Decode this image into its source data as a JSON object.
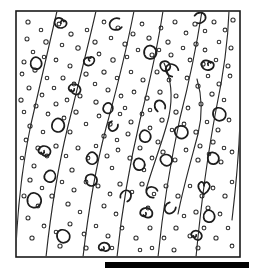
{
  "figure": {
    "description": "Rectangular framed line drawing showing sub-parallel flowing lamination lines with scattered small open circular grains and larger curved comma, C and spiral shaped bioclast outlines.",
    "background_color": "#ffffff",
    "ink_color": "#1a1a1a",
    "bar_color": "#000000"
  },
  "frame": {
    "name": "outer-frame",
    "x": 16,
    "y": 11,
    "width": 224,
    "height": 246,
    "stroke_color": "#1a1a1a",
    "stroke_width": 1.6,
    "fill_color": "#ffffff"
  },
  "base_bar": {
    "name": "base-bar",
    "x": 105,
    "y": 262,
    "width": 144,
    "height": 6,
    "color": "#000000"
  },
  "flow_lines": {
    "count": 9,
    "stroke_color": "#2a2a2a",
    "stroke_width": 1.15,
    "paths": [
      "M 57 11 C 49 45, 40 84, 31 124 C 23 161, 18 205, 16 246",
      "M 96 11 C 88 46, 78 86, 68 126 C 59 163, 51 210, 46 257",
      "M 134 11 C 127 47, 117 88, 106 128 C 96 166, 88 214, 83 257",
      "M 163 11 C 158 44, 150 81, 140 120 C 131 158, 122 209, 117 257",
      "M 202 11 C 197 43, 190 79, 180 118 C 172 155, 163 208, 158 257",
      "M 229 11 C 228 40, 224 72, 216 110 C 209 147, 201 205, 196 257",
      "M 164 63 C 171 78, 173 96, 169 116 C 164 138, 153 165, 146 190",
      "M 197 79 C 202 96, 203 114, 198 134 C 192 157, 183 188, 178 214",
      "M 240 122 C 239 150, 236 186, 232 220"
    ]
  },
  "grain_dots": {
    "name": "ooid-grains",
    "count": 150,
    "stroke_color": "#2d2d2d",
    "radius_min": 1.6,
    "radius_max": 3.1,
    "points": [
      [
        28,
        22,
        2.1
      ],
      [
        41,
        30,
        1.8
      ],
      [
        27,
        39,
        2.0
      ],
      [
        46,
        42,
        2.2
      ],
      [
        33,
        52,
        1.8
      ],
      [
        24,
        62,
        2.0
      ],
      [
        44,
        57,
        1.7
      ],
      [
        59,
        24,
        1.9
      ],
      [
        71,
        34,
        2.1
      ],
      [
        62,
        45,
        1.8
      ],
      [
        78,
        48,
        2.2
      ],
      [
        56,
        60,
        1.9
      ],
      [
        70,
        66,
        2.0
      ],
      [
        87,
        30,
        1.8
      ],
      [
        95,
        42,
        2.1
      ],
      [
        104,
        22,
        1.9
      ],
      [
        118,
        28,
        2.0
      ],
      [
        111,
        38,
        1.8
      ],
      [
        125,
        44,
        2.1
      ],
      [
        99,
        54,
        1.9
      ],
      [
        113,
        60,
        2.2
      ],
      [
        127,
        57,
        1.8
      ],
      [
        133,
        34,
        2.0
      ],
      [
        142,
        24,
        1.9
      ],
      [
        149,
        38,
        2.1
      ],
      [
        138,
        50,
        1.8
      ],
      [
        152,
        55,
        2.0
      ],
      [
        161,
        28,
        1.9
      ],
      [
        168,
        42,
        2.1
      ],
      [
        159,
        50,
        1.8
      ],
      [
        175,
        22,
        2.0
      ],
      [
        186,
        33,
        1.9
      ],
      [
        195,
        24,
        2.1
      ],
      [
        205,
        31,
        1.8
      ],
      [
        214,
        22,
        2.0
      ],
      [
        225,
        30,
        1.9
      ],
      [
        233,
        20,
        2.1
      ],
      [
        219,
        42,
        1.8
      ],
      [
        231,
        48,
        2.0
      ],
      [
        205,
        50,
        1.9
      ],
      [
        196,
        44,
        2.1
      ],
      [
        183,
        48,
        1.8
      ],
      [
        171,
        55,
        2.0
      ],
      [
        190,
        60,
        1.9
      ],
      [
        203,
        64,
        2.1
      ],
      [
        216,
        60,
        1.8
      ],
      [
        228,
        66,
        2.0
      ],
      [
        22,
        74,
        1.9
      ],
      [
        35,
        70,
        2.1
      ],
      [
        47,
        78,
        1.8
      ],
      [
        29,
        88,
        2.0
      ],
      [
        42,
        95,
        1.9
      ],
      [
        21,
        100,
        2.1
      ],
      [
        54,
        88,
        1.8
      ],
      [
        63,
        78,
        2.0
      ],
      [
        74,
        84,
        1.9
      ],
      [
        86,
        74,
        2.1
      ],
      [
        95,
        84,
        1.8
      ],
      [
        80,
        96,
        2.0
      ],
      [
        67,
        100,
        1.9
      ],
      [
        104,
        72,
        2.1
      ],
      [
        117,
        78,
        1.8
      ],
      [
        108,
        90,
        2.0
      ],
      [
        121,
        96,
        1.9
      ],
      [
        96,
        102,
        2.1
      ],
      [
        131,
        72,
        1.8
      ],
      [
        143,
        80,
        2.0
      ],
      [
        134,
        92,
        1.9
      ],
      [
        147,
        98,
        2.1
      ],
      [
        125,
        108,
        1.8
      ],
      [
        157,
        72,
        2.0
      ],
      [
        169,
        80,
        1.9
      ],
      [
        160,
        92,
        2.1
      ],
      [
        150,
        110,
        1.8
      ],
      [
        176,
        96,
        2.0
      ],
      [
        187,
        78,
        1.9
      ],
      [
        198,
        86,
        2.1
      ],
      [
        208,
        76,
        1.8
      ],
      [
        219,
        84,
        2.0
      ],
      [
        230,
        76,
        1.9
      ],
      [
        212,
        94,
        2.1
      ],
      [
        224,
        100,
        1.8
      ],
      [
        201,
        104,
        2.0
      ],
      [
        188,
        108,
        1.9
      ],
      [
        176,
        112,
        2.1
      ],
      [
        24,
        112,
        1.8
      ],
      [
        36,
        106,
        2.0
      ],
      [
        48,
        114,
        1.9
      ],
      [
        30,
        126,
        2.1
      ],
      [
        43,
        132,
        1.8
      ],
      [
        56,
        104,
        2.0
      ],
      [
        64,
        118,
        1.9
      ],
      [
        76,
        112,
        2.1
      ],
      [
        86,
        124,
        1.8
      ],
      [
        70,
        132,
        2.0
      ],
      [
        99,
        116,
        1.9
      ],
      [
        110,
        124,
        2.1
      ],
      [
        120,
        114,
        1.8
      ],
      [
        131,
        122,
        2.0
      ],
      [
        142,
        114,
        1.9
      ],
      [
        104,
        136,
        2.1
      ],
      [
        117,
        140,
        1.8
      ],
      [
        128,
        134,
        2.0
      ],
      [
        150,
        128,
        1.9
      ],
      [
        162,
        120,
        2.1
      ],
      [
        172,
        130,
        1.8
      ],
      [
        158,
        142,
        2.0
      ],
      [
        184,
        124,
        1.9
      ],
      [
        196,
        132,
        2.1
      ],
      [
        207,
        122,
        1.8
      ],
      [
        218,
        130,
        2.0
      ],
      [
        229,
        120,
        1.9
      ],
      [
        213,
        142,
        2.1
      ],
      [
        224,
        148,
        1.8
      ],
      [
        200,
        146,
        2.0
      ],
      [
        26,
        140,
        1.9
      ],
      [
        38,
        148,
        2.1
      ],
      [
        22,
        158,
        1.8
      ],
      [
        34,
        166,
        2.0
      ],
      [
        47,
        156,
        1.9
      ],
      [
        56,
        146,
        2.1
      ],
      [
        66,
        156,
        1.8
      ],
      [
        78,
        148,
        2.0
      ],
      [
        88,
        158,
        1.9
      ],
      [
        72,
        170,
        2.1
      ],
      [
        96,
        146,
        1.8
      ],
      [
        107,
        156,
        2.0
      ],
      [
        118,
        150,
        1.9
      ],
      [
        130,
        158,
        2.1
      ],
      [
        112,
        168,
        1.8
      ],
      [
        140,
        148,
        2.0
      ],
      [
        152,
        158,
        1.9
      ],
      [
        163,
        152,
        2.1
      ],
      [
        144,
        170,
        1.8
      ],
      [
        175,
        160,
        2.0
      ],
      [
        186,
        150,
        1.9
      ],
      [
        198,
        160,
        2.1
      ],
      [
        209,
        154,
        1.8
      ],
      [
        221,
        162,
        2.0
      ],
      [
        232,
        152,
        1.9
      ],
      [
        30,
        180,
        2.1
      ],
      [
        42,
        188,
        1.8
      ],
      [
        24,
        196,
        2.0
      ],
      [
        38,
        206,
        1.9
      ],
      [
        52,
        196,
        2.1
      ],
      [
        62,
        182,
        1.8
      ],
      [
        74,
        190,
        2.0
      ],
      [
        86,
        182,
        1.9
      ],
      [
        68,
        204,
        2.1
      ],
      [
        80,
        212,
        1.8
      ],
      [
        98,
        186,
        2.0
      ],
      [
        110,
        194,
        1.9
      ],
      [
        120,
        184,
        2.1
      ],
      [
        132,
        192,
        1.8
      ],
      [
        104,
        206,
        2.0
      ],
      [
        116,
        214,
        1.9
      ],
      [
        142,
        184,
        2.1
      ],
      [
        154,
        194,
        1.8
      ],
      [
        166,
        186,
        2.0
      ],
      [
        148,
        208,
        1.9
      ],
      [
        178,
        196,
        2.1
      ],
      [
        190,
        186,
        1.8
      ],
      [
        202,
        196,
        2.0
      ],
      [
        213,
        188,
        1.9
      ],
      [
        225,
        196,
        2.1
      ],
      [
        232,
        182,
        1.8
      ],
      [
        208,
        208,
        2.0
      ],
      [
        220,
        214,
        1.9
      ],
      [
        196,
        212,
        2.1
      ],
      [
        184,
        216,
        1.8
      ],
      [
        28,
        218,
        2.0
      ],
      [
        44,
        226,
        1.9
      ],
      [
        32,
        238,
        2.1
      ],
      [
        56,
        232,
        1.8
      ],
      [
        70,
        224,
        2.0
      ],
      [
        84,
        234,
        1.9
      ],
      [
        60,
        246,
        2.1
      ],
      [
        96,
        226,
        1.8
      ],
      [
        108,
        236,
        2.0
      ],
      [
        122,
        228,
        1.9
      ],
      [
        136,
        238,
        2.1
      ],
      [
        112,
        248,
        1.8
      ],
      [
        150,
        228,
        2.0
      ],
      [
        164,
        238,
        1.9
      ],
      [
        176,
        228,
        2.1
      ],
      [
        152,
        248,
        1.8
      ],
      [
        190,
        236,
        2.0
      ],
      [
        204,
        228,
        1.9
      ],
      [
        216,
        238,
        2.1
      ],
      [
        228,
        228,
        1.8
      ],
      [
        198,
        248,
        2.0
      ],
      [
        232,
        246,
        1.9
      ],
      [
        86,
        248,
        2.1
      ],
      [
        140,
        250,
        1.8
      ],
      [
        174,
        250,
        2.0
      ]
    ]
  },
  "shell_glyphs": {
    "name": "bioclast-outlines",
    "count": 34,
    "stroke_color": "#1d1d1d",
    "stroke_width": 1.7,
    "items": [
      {
        "shape": "spiral",
        "x": 61,
        "y": 22,
        "size": 9,
        "rotation": 10
      },
      {
        "shape": "c-open",
        "x": 116,
        "y": 24,
        "size": 9,
        "rotation": -15
      },
      {
        "shape": "c-open",
        "x": 200,
        "y": 18,
        "size": 8,
        "rotation": 160
      },
      {
        "shape": "blob",
        "x": 36,
        "y": 63,
        "size": 8,
        "rotation": 25
      },
      {
        "shape": "spiral",
        "x": 89,
        "y": 60,
        "size": 8,
        "rotation": -30
      },
      {
        "shape": "blob",
        "x": 150,
        "y": 52,
        "size": 9,
        "rotation": 15
      },
      {
        "shape": "c-open",
        "x": 172,
        "y": 70,
        "size": 9,
        "rotation": 45
      },
      {
        "shape": "spiral",
        "x": 208,
        "y": 64,
        "size": 9,
        "rotation": 0
      },
      {
        "shape": "blob",
        "x": 165,
        "y": 66,
        "size": 7,
        "rotation": -20
      },
      {
        "shape": "spiral",
        "x": 74,
        "y": 90,
        "size": 9,
        "rotation": 200
      },
      {
        "shape": "blob",
        "x": 108,
        "y": 108,
        "size": 7,
        "rotation": 40
      },
      {
        "shape": "c-open",
        "x": 160,
        "y": 106,
        "size": 8,
        "rotation": 70
      },
      {
        "shape": "blob",
        "x": 219,
        "y": 114,
        "size": 9,
        "rotation": -10
      },
      {
        "shape": "blob",
        "x": 58,
        "y": 125,
        "size": 9,
        "rotation": 30
      },
      {
        "shape": "c-open",
        "x": 113,
        "y": 126,
        "size": 7,
        "rotation": -60
      },
      {
        "shape": "blob",
        "x": 145,
        "y": 136,
        "size": 8,
        "rotation": 20
      },
      {
        "shape": "blob",
        "x": 181,
        "y": 132,
        "size": 9,
        "rotation": -25
      },
      {
        "shape": "spiral",
        "x": 44,
        "y": 152,
        "size": 9,
        "rotation": 190
      },
      {
        "shape": "blob",
        "x": 92,
        "y": 158,
        "size": 8,
        "rotation": 35
      },
      {
        "shape": "blob",
        "x": 139,
        "y": 164,
        "size": 8,
        "rotation": 10
      },
      {
        "shape": "blob",
        "x": 166,
        "y": 160,
        "size": 8,
        "rotation": -35
      },
      {
        "shape": "blob",
        "x": 213,
        "y": 158,
        "size": 8,
        "rotation": 5
      },
      {
        "shape": "blob",
        "x": 50,
        "y": 176,
        "size": 8,
        "rotation": 50
      },
      {
        "shape": "blob",
        "x": 91,
        "y": 180,
        "size": 8,
        "rotation": -15
      },
      {
        "shape": "c-open",
        "x": 152,
        "y": 192,
        "size": 8,
        "rotation": 30
      },
      {
        "shape": "heart",
        "x": 204,
        "y": 188,
        "size": 9,
        "rotation": 0
      },
      {
        "shape": "blob",
        "x": 34,
        "y": 200,
        "size": 10,
        "rotation": 15
      },
      {
        "shape": "c-open",
        "x": 126,
        "y": 196,
        "size": 8,
        "rotation": 120
      },
      {
        "shape": "spiral",
        "x": 146,
        "y": 214,
        "size": 9,
        "rotation": 180
      },
      {
        "shape": "c-open",
        "x": 170,
        "y": 208,
        "size": 8,
        "rotation": -50
      },
      {
        "shape": "blob",
        "x": 209,
        "y": 216,
        "size": 8,
        "rotation": 25
      },
      {
        "shape": "blob",
        "x": 63,
        "y": 236,
        "size": 9,
        "rotation": -10
      },
      {
        "shape": "spiral",
        "x": 104,
        "y": 248,
        "size": 8,
        "rotation": 170
      },
      {
        "shape": "spiral",
        "x": 196,
        "y": 236,
        "size": 8,
        "rotation": 200
      }
    ]
  }
}
